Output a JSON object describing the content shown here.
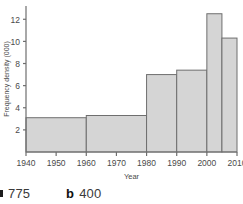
{
  "chart_data": {
    "type": "bar",
    "title": "",
    "xlabel": "Year",
    "ylabel": "Frequency density (000)",
    "xlim": [
      1940,
      2010
    ],
    "ylim": [
      0,
      13.2
    ],
    "xticks": [
      1940,
      1950,
      1960,
      1970,
      1980,
      1990,
      2000,
      2010
    ],
    "xtick_labels": [
      "1940",
      "1950",
      "1960",
      "1970",
      "1980",
      "1990",
      "2000",
      "2010"
    ],
    "yticks": [
      2,
      4,
      6,
      8,
      10,
      12
    ],
    "ytick_labels": [
      "2",
      "4",
      "6",
      "8",
      "10",
      "12"
    ],
    "grid": false,
    "legend": null,
    "bin_edges": [
      1940,
      1960,
      1980,
      1990,
      2000,
      2005,
      2010
    ],
    "bars": [
      {
        "x0": 1940,
        "x1": 1960,
        "height": 3.1,
        "label": "1940-1960"
      },
      {
        "x0": 1960,
        "x1": 1980,
        "height": 3.3,
        "label": "1960-1980"
      },
      {
        "x0": 1980,
        "x1": 1990,
        "height": 7.0,
        "label": "1980-1990"
      },
      {
        "x0": 1990,
        "x1": 2000,
        "height": 7.4,
        "label": "1990-2000"
      },
      {
        "x0": 2000,
        "x1": 2005,
        "height": 12.5,
        "label": "2000-2005"
      },
      {
        "x0": 2005,
        "x1": 2010,
        "height": 10.3,
        "label": "2005-2010"
      }
    ],
    "bar_fill": "#d5d5d5",
    "bar_stroke": "#6e6e6e",
    "axis_color": "#6e6e6e"
  },
  "answers": [
    {
      "marker": "a",
      "value": "775",
      "clipped": true
    },
    {
      "marker": "b",
      "value": "400",
      "clipped": false
    }
  ]
}
